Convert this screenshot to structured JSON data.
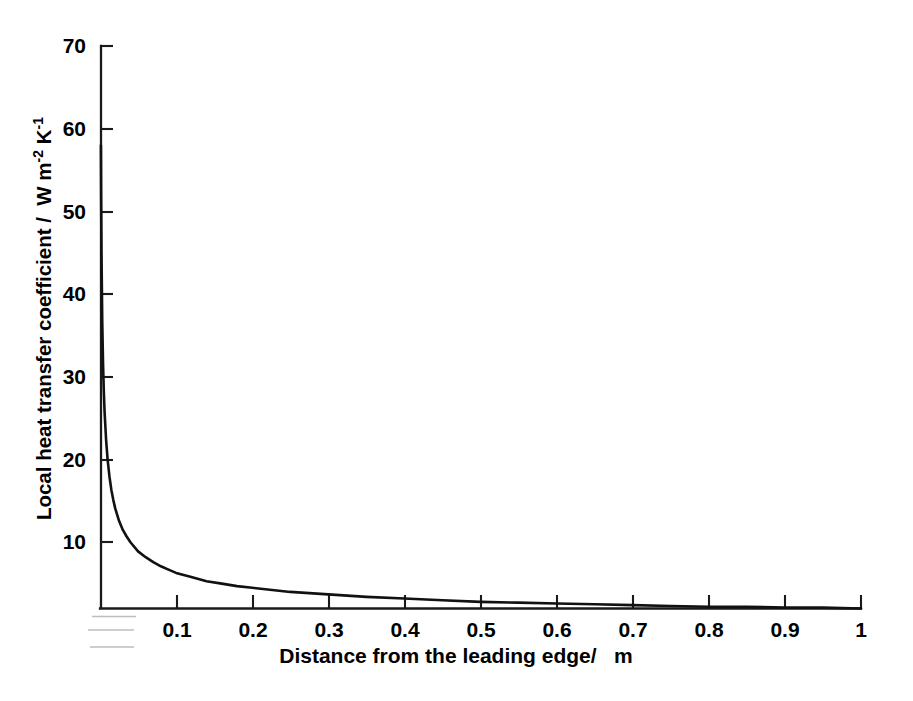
{
  "figure": {
    "background_color": "#ffffff",
    "line_color": "#111111",
    "axis_color": "#1a1a1a",
    "artifact_color": "#b9b9b9"
  },
  "chart_data": {
    "type": "line",
    "title": "",
    "subtitle": "",
    "xlabel": "Distance from the leading edge/   m",
    "ylabel": "Local heat transfer coefficient /  W m-2 K-1",
    "ylabel_parts": {
      "main": "Local heat transfer coefficient /  W m",
      "sup1": "-2",
      "mid": " K",
      "sup2": "-1"
    },
    "xlim": [
      0,
      1.0
    ],
    "ylim": [
      0,
      70
    ],
    "grid": false,
    "legend": null,
    "xticks": [
      0.1,
      0.2,
      0.3,
      0.4,
      0.5,
      0.6,
      0.7,
      0.8,
      0.9,
      1.0
    ],
    "xticklabels": [
      "0.1",
      "0.2",
      "0.3",
      "0.4",
      "0.5",
      "0.6",
      "0.7",
      "0.8",
      "0.9",
      "1"
    ],
    "yticks": [
      10,
      20,
      30,
      40,
      50,
      60,
      70
    ],
    "yticklabels": [
      "10",
      "20",
      "30",
      "40",
      "50",
      "60",
      "70"
    ],
    "relation": "h = 2.0 * x^(-0.5)",
    "series": [
      {
        "name": "local heat transfer coefficient",
        "x": [
          0.0012,
          0.0015,
          0.002,
          0.003,
          0.004,
          0.005,
          0.006,
          0.008,
          0.01,
          0.0125,
          0.015,
          0.0175,
          0.02,
          0.025,
          0.03,
          0.035,
          0.04,
          0.05,
          0.06,
          0.07,
          0.08,
          0.09,
          0.1,
          0.12,
          0.14,
          0.16,
          0.18,
          0.2,
          0.25,
          0.3,
          0.35,
          0.4,
          0.45,
          0.5,
          0.55,
          0.6,
          0.65,
          0.7,
          0.75,
          0.8,
          0.85,
          0.9,
          0.95,
          1.0
        ],
        "y": [
          58.0,
          51.6,
          44.7,
          36.5,
          31.6,
          28.3,
          25.8,
          22.4,
          20.0,
          17.9,
          16.3,
          15.1,
          14.1,
          12.6,
          11.5,
          10.7,
          10.0,
          8.9,
          8.2,
          7.6,
          7.1,
          6.7,
          6.3,
          5.8,
          5.3,
          5.0,
          4.7,
          4.5,
          4.0,
          3.7,
          3.4,
          3.2,
          3.0,
          2.8,
          2.7,
          2.6,
          2.5,
          2.4,
          2.3,
          2.2,
          2.2,
          2.1,
          2.1,
          2.0
        ]
      }
    ]
  },
  "axes_geometry": {
    "origin_px": {
      "x": 100,
      "y": 625
    },
    "x_end_px": 861,
    "y_top_px": 46,
    "px_per_x_unit": 761,
    "px_per_y_unit": 8.271
  },
  "artifacts": {
    "note": "faint scanned rule lines under left of x-axis",
    "lines": [
      {
        "x1": 92,
        "y1": 616,
        "x2": 135,
        "y2": 616
      },
      {
        "x1": 88,
        "y1": 629,
        "x2": 133,
        "y2": 629
      },
      {
        "x1": 90,
        "y1": 646,
        "x2": 133,
        "y2": 646
      }
    ]
  }
}
